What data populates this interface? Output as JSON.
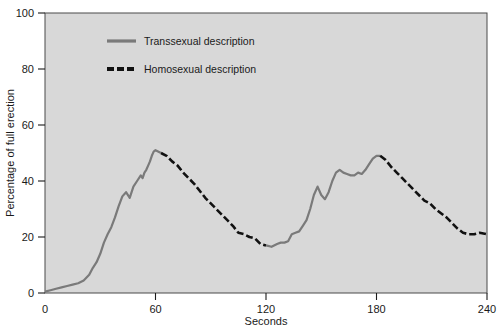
{
  "chart_data": {
    "type": "line",
    "title": "",
    "xlabel": "Seconds",
    "ylabel": "Percentage of full erection",
    "xlim": [
      0,
      240
    ],
    "ylim": [
      0,
      100
    ],
    "xticks": [
      0,
      60,
      120,
      180,
      240
    ],
    "xticklabels": [
      "0",
      "60",
      "120",
      "180",
      "240"
    ],
    "yticks": [
      0,
      20,
      40,
      60,
      80,
      100
    ],
    "yticklabels": [
      "0",
      "20",
      "40",
      "60",
      "80",
      "100"
    ],
    "grid": false,
    "legend_position": "upper-center",
    "plot_background": "#d8d8d8",
    "figure_background": "#ffffff",
    "series": [
      {
        "name": "Transsexual description",
        "style": "solid",
        "color": "#7a7a7a",
        "linewidth": 2.2,
        "x": [
          0,
          3,
          6,
          9,
          12,
          15,
          18,
          21,
          24,
          26,
          28,
          30,
          32,
          34,
          36,
          38,
          40,
          42,
          44,
          46,
          48,
          50,
          52,
          53,
          54,
          55,
          56,
          57,
          58,
          59,
          60,
          63
        ],
        "values": [
          0.5,
          1.0,
          1.5,
          2.0,
          2.5,
          3.0,
          3.5,
          4.5,
          6.5,
          9.0,
          11.0,
          14.0,
          18.0,
          21.0,
          23.5,
          27.0,
          31.0,
          34.5,
          36.0,
          34.0,
          38.0,
          40.0,
          42.0,
          41.0,
          43.0,
          44.0,
          45.5,
          47.0,
          49.0,
          50.5,
          51.0,
          50.0
        ]
      },
      {
        "name": "Homosexual description",
        "style": "dashed",
        "color": "#111111",
        "linewidth": 2.6,
        "x": [
          63,
          66,
          69,
          72,
          75,
          78,
          81,
          84,
          87,
          90,
          93,
          96,
          99,
          102,
          105,
          108,
          111,
          114,
          117,
          120
        ],
        "values": [
          50.0,
          49.0,
          47.0,
          45.5,
          43.0,
          41.0,
          39.0,
          36.5,
          34.0,
          32.0,
          30.0,
          28.0,
          26.0,
          24.0,
          21.5,
          21.0,
          20.0,
          19.5,
          17.5,
          17.0
        ]
      },
      {
        "name": "Transsexual description",
        "style": "solid",
        "color": "#7a7a7a",
        "linewidth": 2.2,
        "x": [
          120,
          123,
          126,
          128,
          130,
          132,
          134,
          136,
          138,
          140,
          142,
          144,
          146,
          148,
          150,
          152,
          154,
          156,
          158,
          160,
          162,
          164,
          166,
          168,
          170,
          172,
          174,
          176,
          178,
          180,
          182
        ],
        "values": [
          17.0,
          16.5,
          17.5,
          18.0,
          18.0,
          18.5,
          21.0,
          21.5,
          22.0,
          24.0,
          26.0,
          30.0,
          35.0,
          38.0,
          35.0,
          33.5,
          36.0,
          40.0,
          43.0,
          44.0,
          43.0,
          42.5,
          42.0,
          42.0,
          43.0,
          42.5,
          44.0,
          46.0,
          48.0,
          49.0,
          49.0
        ]
      },
      {
        "name": "Homosexual description",
        "style": "dashed",
        "color": "#111111",
        "linewidth": 2.6,
        "x": [
          182,
          185,
          188,
          191,
          194,
          197,
          200,
          203,
          206,
          209,
          212,
          215,
          218,
          221,
          224,
          227,
          230,
          233,
          236,
          240
        ],
        "values": [
          49.0,
          47.5,
          45.0,
          43.0,
          41.0,
          39.0,
          37.0,
          35.0,
          33.0,
          32.0,
          30.0,
          28.5,
          27.0,
          25.0,
          23.0,
          21.5,
          21.0,
          21.0,
          21.5,
          21.0
        ]
      }
    ],
    "legend": [
      {
        "label": "Transsexual description",
        "style": "solid",
        "color": "#7a7a7a"
      },
      {
        "label": "Homosexual description",
        "style": "dashed",
        "color": "#111111"
      }
    ]
  }
}
